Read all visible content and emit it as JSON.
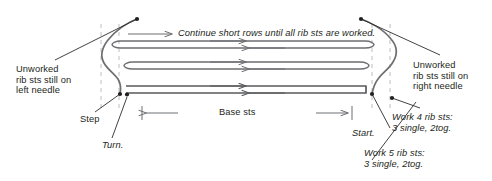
{
  "diagram": {
    "type": "knitting-short-row-diagram",
    "stroke_color": "#6d6e71",
    "accent_color": "#58595b",
    "dash_color": "#bcbec0",
    "text_color": "#231f20",
    "background": "#ffffff"
  },
  "labels": {
    "left_needle": "Unworked\nrib sts still on\nleft needle",
    "right_needle": "Unworked\nrib sts still on\nright needle",
    "continue": "Continue short rows until all rib sts are worked.",
    "step": "Step",
    "turn": "Turn.",
    "base_sts": "Base sts",
    "start": "Start.",
    "work4": "Work 4 rib sts:\n3 single, 2tog.",
    "work5": "Work 5 rib sts:\n3 single, 2tog."
  },
  "rows": [
    {
      "index": 1,
      "direction": "right",
      "y": 41,
      "label": "top short row"
    },
    {
      "index": 2,
      "direction": "left",
      "y": 48,
      "label": "return row 1"
    },
    {
      "index": 3,
      "direction": "right",
      "y": 62,
      "label": "second short row"
    },
    {
      "index": 4,
      "direction": "left",
      "y": 69,
      "label": "return row 2"
    },
    {
      "index": 5,
      "direction": "right",
      "y": 86,
      "label": "base row out"
    },
    {
      "index": 6,
      "direction": "left",
      "y": 93,
      "label": "base row back"
    }
  ],
  "guides": {
    "dashed_x": [
      101,
      119,
      372,
      390
    ],
    "base_sts_span": [
      142,
      352
    ]
  }
}
